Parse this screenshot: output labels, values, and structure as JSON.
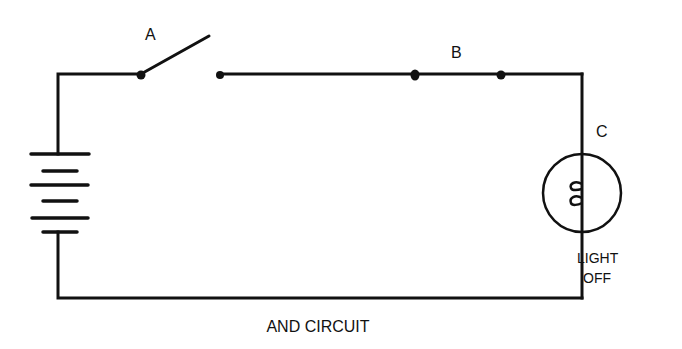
{
  "diagram": {
    "title": "AND CIRCUIT",
    "labels": {
      "switch": "A",
      "junction": "B",
      "lamp": "C",
      "lamp_state_line1": "LIGHT",
      "lamp_state_line2": "OFF"
    },
    "components": [
      {
        "id": "battery",
        "type": "battery",
        "icon": "battery-icon"
      },
      {
        "id": "A",
        "type": "switch",
        "state": "open",
        "icon": "switch-icon"
      },
      {
        "id": "B",
        "type": "open-contacts",
        "icon": "contact-points-icon"
      },
      {
        "id": "C",
        "type": "lamp",
        "state": "off",
        "icon": "lamp-icon"
      }
    ],
    "colors": {
      "line": "#111111",
      "background": "#ffffff"
    }
  }
}
